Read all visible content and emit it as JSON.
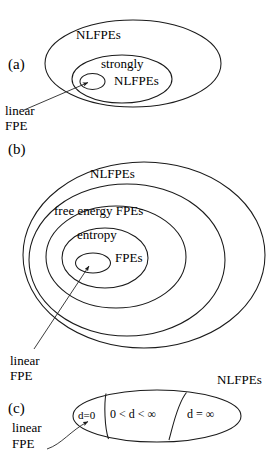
{
  "figure": {
    "caption_ghost": "",
    "stroke_color": "#1a1a1a",
    "text_color": "#000000",
    "background_color": "#ffffff"
  },
  "panels": [
    {
      "id": "(a)",
      "sets": [
        {
          "name": "outer-set",
          "label": "NLFPEs"
        },
        {
          "name": "middle-set",
          "label_line1": "strongly",
          "label_line2": "NLFPEs"
        },
        {
          "name": "inner-set",
          "label": ""
        }
      ],
      "annotation": {
        "line1": "linear",
        "line2": "FPE"
      }
    },
    {
      "id": "(b)",
      "sets": [
        {
          "name": "outer-set",
          "label": "NLFPEs"
        },
        {
          "name": "second-set",
          "label": "free energy FPEs"
        },
        {
          "name": "third-set",
          "label_line1": "entropy",
          "label_line2": "FPEs"
        },
        {
          "name": "inner-set",
          "label": ""
        }
      ],
      "annotation": {
        "line1": "linear",
        "line2": "FPE"
      }
    },
    {
      "id": "(c)",
      "outer_label": "NLFPEs",
      "regions": [
        {
          "name": "region-d-zero",
          "label": "d=0"
        },
        {
          "name": "region-d-finite",
          "label": "0 < d < ∞"
        },
        {
          "name": "region-d-infinite",
          "label": "d = ∞"
        }
      ],
      "annotation": {
        "line1": "linear",
        "line2": "FPE"
      }
    }
  ]
}
